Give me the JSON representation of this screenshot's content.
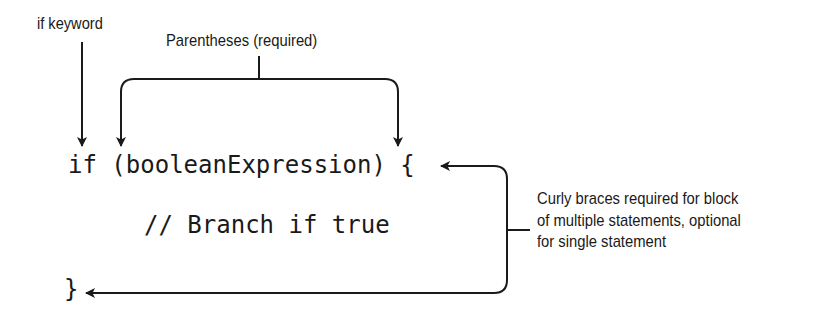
{
  "diagram": {
    "annotations": {
      "if_keyword": "if keyword",
      "parentheses": "Parentheses (required)",
      "curly_braces": [
        "Curly braces required for block",
        "of multiple statements, optional",
        "for single statement"
      ]
    },
    "code": {
      "line1": "if (booleanExpression) {",
      "line2": "// Branch if true",
      "line3": "}"
    },
    "colors": {
      "ink": "#1a1a1a",
      "background": "#ffffff"
    }
  }
}
